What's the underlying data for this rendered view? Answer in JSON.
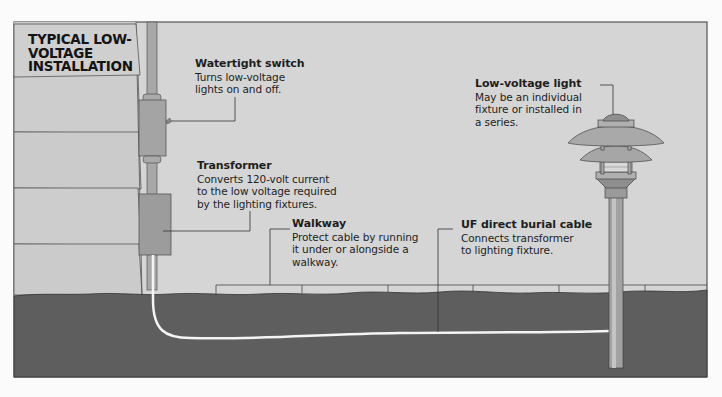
{
  "title": {
    "lines": [
      "TYPICAL LOW-",
      "VOLTAGE",
      "INSTALLATION"
    ]
  },
  "callouts": [
    {
      "id": "watertight-switch",
      "title": "Watertight switch",
      "lines": [
        "Turns low-voltage",
        "lights on and off."
      ]
    },
    {
      "id": "transformer",
      "title": "Transformer",
      "lines": [
        "Converts 120-volt current",
        "to the low voltage required",
        "by the lighting fixtures."
      ]
    },
    {
      "id": "walkway",
      "title": "Walkway",
      "lines": [
        "Protect cable by running",
        "it under or alongside a",
        "walkway."
      ]
    },
    {
      "id": "uf-cable",
      "title": "UF direct burial cable",
      "lines": [
        "Connects transformer",
        "to lighting fixture."
      ]
    },
    {
      "id": "low-voltage-light",
      "title": "Low-voltage light",
      "lines": [
        "May be an individual",
        "fixture or installed in",
        "a series."
      ]
    }
  ],
  "colors": {
    "sky": "#d4d4d4",
    "soil": "#5d5d5d",
    "siding": "#c9c9c9",
    "box": "#9a9a9a",
    "conduit": "#a8a8a8",
    "line": "#3a3a3a",
    "cable": "#f2f2f2"
  }
}
